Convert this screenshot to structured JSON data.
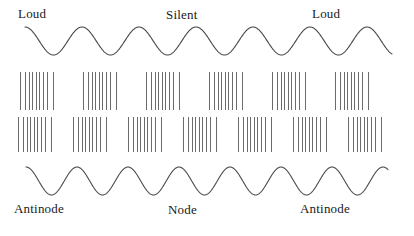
{
  "figure": {
    "width": 414,
    "height": 236,
    "background_color": "#ffffff",
    "stroke_color": "#4a4a4a",
    "tick_color": "#6b6b6b",
    "text_color": "#1a1a1a"
  },
  "labels": {
    "loud_left": "Loud",
    "silent": "Silent",
    "loud_right": "Loud",
    "antinode_left": "Antinode",
    "node": "Node",
    "antinode_right": "Antinode"
  },
  "chart_data": {
    "type": "line",
    "xlabel": "",
    "ylabel": "",
    "grid": false,
    "legend": "none",
    "annotations": [
      {
        "text": "Loud",
        "x": 18,
        "y": 7
      },
      {
        "text": "Silent",
        "x": 166,
        "y": 8
      },
      {
        "text": "Loud",
        "x": 312,
        "y": 7
      },
      {
        "text": "Antinode",
        "x": 14,
        "y": 202
      },
      {
        "text": "Node",
        "x": 168,
        "y": 203
      },
      {
        "text": "Antinode",
        "x": 300,
        "y": 202
      }
    ],
    "series": [
      {
        "name": "upper-wave",
        "role": "displacement-wave-top",
        "x_start": 25,
        "x_end": 392,
        "baseline_y": 41,
        "amplitude": 14,
        "wavelength": 57,
        "cycles": 6.45,
        "phase": "peak-first"
      },
      {
        "name": "lower-wave",
        "role": "displacement-wave-bottom",
        "x_start": 26,
        "x_end": 388,
        "baseline_y": 181,
        "amplitude": 14,
        "wavelength": 51,
        "cycles": 7.1,
        "phase": "peak-first"
      }
    ],
    "tick_rows": [
      {
        "name": "particle-row-top",
        "y_top": 72,
        "y_bottom": 110,
        "group_count": 6,
        "group_start_x": 20,
        "group_period": 63,
        "lines_per_group": 9,
        "group_offsets": [
          0,
          5,
          9,
          12.5,
          16,
          19.5,
          23,
          27,
          33
        ]
      },
      {
        "name": "particle-row-bottom",
        "y_top": 117,
        "y_bottom": 152,
        "group_count": 7,
        "group_start_x": 18,
        "group_period": 55,
        "lines_per_group": 9,
        "group_offsets": [
          0,
          5,
          9,
          12.5,
          16,
          19.5,
          23,
          27,
          33
        ]
      }
    ]
  }
}
